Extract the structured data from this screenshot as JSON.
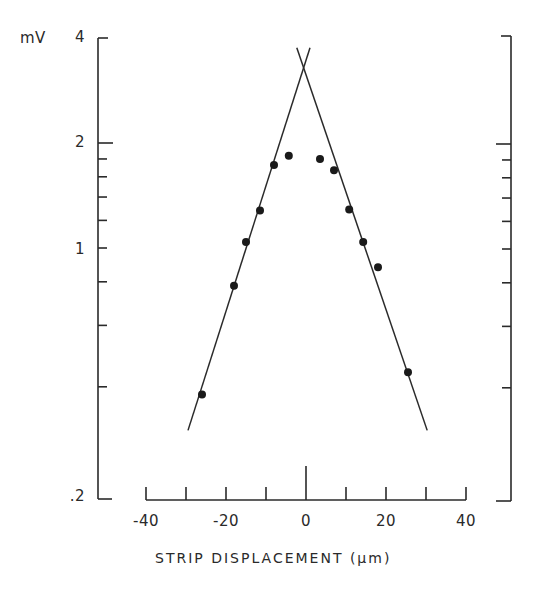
{
  "chart_data": {
    "type": "scatter",
    "title": "",
    "xlabel": "STRIP DISPLACEMENT (μm)",
    "ylabel": "mV",
    "yscale": "log",
    "xlim": [
      -40,
      40
    ],
    "ylim": [
      0.2,
      4
    ],
    "grid": false,
    "legend": null,
    "x_ticks": [
      -40,
      -30,
      -20,
      -10,
      0,
      10,
      20,
      30,
      40
    ],
    "x_tick_labels": [
      "-40",
      "-20",
      "0",
      "20",
      "40"
    ],
    "x_tick_label_values": [
      -40,
      -20,
      0,
      20,
      40
    ],
    "y_ticks": [
      4,
      2,
      1.8,
      1.6,
      1.4,
      1.2,
      1,
      0.8,
      0.6,
      0.4,
      0.2
    ],
    "y_tick_labels": [
      "4",
      "2",
      "1",
      ".2"
    ],
    "y_tick_label_values": [
      4,
      2,
      1,
      0.2
    ],
    "series": [
      {
        "name": "measured",
        "style": "filled-circle",
        "x": [
          -26,
          -18,
          -15,
          -11.5,
          -8,
          -4.3,
          3.5,
          7,
          10.8,
          14.3,
          18,
          25.5
        ],
        "y": [
          0.38,
          0.78,
          1.04,
          1.28,
          1.73,
          1.84,
          1.8,
          1.67,
          1.29,
          1.04,
          0.88,
          0.44
        ]
      },
      {
        "name": "left-fit-line",
        "style": "line",
        "x": [
          -29.5,
          1.0
        ],
        "y": [
          0.3,
          3.75
        ]
      },
      {
        "name": "right-fit-line",
        "style": "line",
        "x": [
          -2.3,
          30.3
        ],
        "y": [
          3.75,
          0.3
        ]
      }
    ],
    "annotations": [
      {
        "text": "lines intersect near x = -0.5 μm, y ≈ 3.3 mV"
      }
    ]
  },
  "labels": {
    "y_unit": "mV",
    "y4": "4",
    "y2": "2",
    "y1": "1",
    "y02": ".2",
    "xm40": "-40",
    "xm20": "-20",
    "x0": "0",
    "x20": "20",
    "x40": "40",
    "xlabel": "STRIP DISPLACEMENT (μm)"
  }
}
